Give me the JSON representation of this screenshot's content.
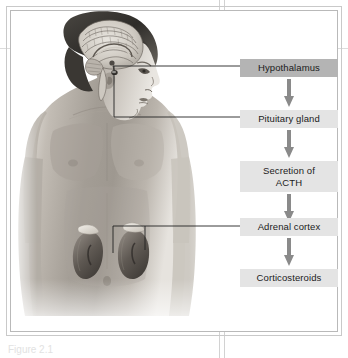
{
  "figure": {
    "caption_fragment": "Figure 2.1"
  },
  "colors": {
    "box_dark": "#b4b4b4",
    "box_light": "#e4e4e4",
    "arrow": "#8a8a8a",
    "leader_line": "#222222",
    "frame": "#b9b9b9",
    "page_rule": "#dcdcdc"
  },
  "flowchart": {
    "type": "flow",
    "orientation": "vertical",
    "steps": [
      {
        "label": "Hypothalamus",
        "shade": "dark",
        "lines": [
          "Hypothalamus"
        ]
      },
      {
        "label": "Pituitary gland",
        "shade": "light",
        "lines": [
          "Pituitary gland"
        ]
      },
      {
        "label": "Secretion of ACTH",
        "shade": "light",
        "lines": [
          "Secretion of",
          "ACTH"
        ]
      },
      {
        "label": "Adrenal cortex",
        "shade": "light",
        "lines": [
          "Adrenal cortex"
        ]
      },
      {
        "label": "Corticosteroids",
        "shade": "light",
        "lines": [
          "Corticosteroids"
        ]
      }
    ],
    "arrow_count": 4
  },
  "labels": {
    "step1": "Hypothalamus",
    "step2": "Pituitary gland",
    "step3_line1": "Secretion of",
    "step3_line2": "ACTH",
    "step4": "Adrenal cortex",
    "step5": "Corticosteroids"
  },
  "anatomy": {
    "subject": "male human upper body, left profile head with sagittal brain section",
    "parts": [
      {
        "name": "brain",
        "pointer_to": "Hypothalamus"
      },
      {
        "name": "pituitary-gland",
        "pointer_to": "Pituitary gland"
      },
      {
        "name": "left-kidney-adrenal",
        "pointer_to": "Adrenal cortex"
      },
      {
        "name": "right-kidney-adrenal",
        "pointer_to": "Adrenal cortex"
      }
    ]
  }
}
